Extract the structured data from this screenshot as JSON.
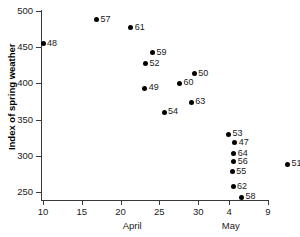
{
  "chart_data": {
    "type": "scatter",
    "title": "",
    "xlabel": "",
    "ylabel": "Index of spring weather",
    "xlim": [
      8,
      41
    ],
    "ylim": [
      238,
      512
    ],
    "grid": false,
    "legend": null,
    "y_ticks": [
      500,
      450,
      400,
      350,
      300,
      250
    ],
    "x_ticks": [
      {
        "label": "10",
        "day": 10,
        "month": "April"
      },
      {
        "label": "15",
        "day": 15,
        "month": "April"
      },
      {
        "label": "20",
        "day": 20,
        "month": "April"
      },
      {
        "label": "25",
        "day": 25,
        "month": "April"
      },
      {
        "label": "30",
        "day": 30,
        "month": "April"
      },
      {
        "label": "4",
        "day": 34,
        "month": "May"
      },
      {
        "label": "9",
        "day": 39,
        "month": "May"
      }
    ],
    "month_labels": [
      {
        "text": "April",
        "day": 21.5
      },
      {
        "text": "May",
        "day": 34.2
      }
    ],
    "points": [
      {
        "label": "48",
        "x_day": 10.0,
        "y": 455,
        "label_side": "right"
      },
      {
        "label": "57",
        "x_day": 16.9,
        "y": 488,
        "label_side": "right"
      },
      {
        "label": "61",
        "x_day": 21.3,
        "y": 477,
        "label_side": "right"
      },
      {
        "label": "59",
        "x_day": 24.1,
        "y": 442,
        "label_side": "right"
      },
      {
        "label": "52",
        "x_day": 23.2,
        "y": 427,
        "label_side": "right"
      },
      {
        "label": "50",
        "x_day": 29.5,
        "y": 413,
        "label_side": "right"
      },
      {
        "label": "60",
        "x_day": 27.6,
        "y": 400,
        "label_side": "right"
      },
      {
        "label": "49",
        "x_day": 23.1,
        "y": 393,
        "label_side": "right"
      },
      {
        "label": "63",
        "x_day": 29.1,
        "y": 374,
        "label_side": "right"
      },
      {
        "label": "54",
        "x_day": 25.6,
        "y": 360,
        "label_side": "right"
      },
      {
        "label": "53",
        "x_day": 33.9,
        "y": 330,
        "label_side": "right"
      },
      {
        "label": "47",
        "x_day": 34.7,
        "y": 318,
        "label_side": "right"
      },
      {
        "label": "64",
        "x_day": 34.6,
        "y": 303,
        "label_side": "right"
      },
      {
        "label": "56",
        "x_day": 34.6,
        "y": 292,
        "label_side": "right"
      },
      {
        "label": "55",
        "x_day": 34.4,
        "y": 278,
        "label_side": "right"
      },
      {
        "label": "51",
        "x_day": 41.5,
        "y": 288,
        "label_side": "right"
      },
      {
        "label": "62",
        "x_day": 34.5,
        "y": 257,
        "label_side": "right"
      },
      {
        "label": "58",
        "x_day": 35.6,
        "y": 243,
        "label_side": "right"
      }
    ]
  }
}
